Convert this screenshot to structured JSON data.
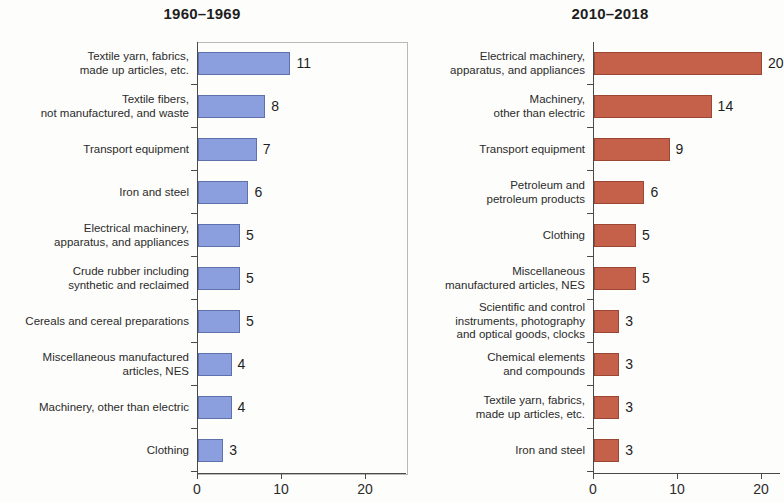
{
  "chart_data": [
    {
      "type": "bar",
      "title": "1960–1969",
      "orientation": "horizontal",
      "xlabel": "",
      "ylabel": "",
      "xlim": [
        0,
        25.5
      ],
      "xticks": [
        "0",
        "10",
        "20"
      ],
      "xtick_values": [
        0,
        10,
        20
      ],
      "grid": false,
      "legend": "none",
      "bar_color": "#8b9ede",
      "bar_border_color": "#5f70ad",
      "categories": [
        "Textile yarn, fabrics,\nmade up articles, etc.",
        "Textile fibers,\nnot manufactured, and waste",
        "Transport equipment",
        "Iron and steel",
        "Electrical machinery,\napparatus, and appliances",
        "Crude rubber including\nsynthetic and reclaimed",
        "Cereals and cereal preparations",
        "Miscellaneous manufactured\narticles, NES",
        "Machinery, other than electric",
        "Clothing"
      ],
      "values": [
        11,
        8,
        7,
        6,
        5,
        5,
        5,
        4,
        4,
        3
      ],
      "value_labels": [
        "11",
        "8",
        "7",
        "6",
        "5",
        "5",
        "5",
        "4",
        "4",
        "3"
      ]
    },
    {
      "type": "bar",
      "title": "2010–2018",
      "orientation": "horizontal",
      "xlabel": "",
      "ylabel": "",
      "xlim": [
        0,
        25.5
      ],
      "xticks": [
        "0",
        "10",
        "20"
      ],
      "xtick_values": [
        0,
        10,
        20
      ],
      "grid": false,
      "legend": "none",
      "bar_color": "#c5604a",
      "bar_border_color": "#9b4734",
      "categories": [
        "Electrical machinery,\napparatus, and appliances",
        "Machinery,\nother than electric",
        "Transport equipment",
        "Petroleum and\npetroleum products",
        "Clothing",
        "Miscellaneous\nmanufactured articles, NES",
        "Scientific and control\ninstruments, photography\nand optical goods, clocks",
        "Chemical elements\nand compounds",
        "Textile yarn, fabrics,\nmade up articles, etc.",
        "Iron and steel"
      ],
      "values": [
        20,
        14,
        9,
        6,
        5,
        5,
        3,
        3,
        3,
        3
      ],
      "value_labels": [
        "20",
        "14",
        "9",
        "6",
        "5",
        "5",
        "3",
        "3",
        "3",
        "3"
      ]
    }
  ]
}
